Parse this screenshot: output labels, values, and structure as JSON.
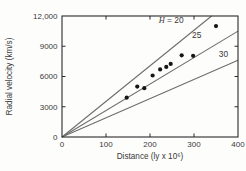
{
  "figure": {
    "background": "#fdfdfc"
  },
  "chart_data": {
    "type": "scatter",
    "title": "",
    "xlabel": "Distance (ly x 10⁶)",
    "ylabel": "Radial velocity (km/s)",
    "xlim": [
      0,
      400
    ],
    "ylim": [
      0,
      12000
    ],
    "grid": false,
    "frame": "full-box with inward ticks on all four sides",
    "xticks": [
      {
        "v": 0,
        "label": "0"
      },
      {
        "v": 100,
        "label": "100"
      },
      {
        "v": 200,
        "label": "200"
      },
      {
        "v": 300,
        "label": "300"
      },
      {
        "v": 400,
        "label": "400"
      }
    ],
    "yticks": [
      {
        "v": 0,
        "label": "0"
      },
      {
        "v": 3000,
        "label": "3000"
      },
      {
        "v": 6000,
        "label": "6000"
      },
      {
        "v": 9000,
        "label": "9000"
      },
      {
        "v": 12000,
        "label": "12,000"
      }
    ],
    "series": [
      {
        "name": "hubble-line-H20",
        "legend": "H = 20",
        "label_italic": "H",
        "label_rest": " = 20",
        "slope_km_s_per_Mly": 20,
        "points": [
          [
            0,
            0
          ],
          [
            340,
            12000
          ]
        ],
        "label_pos": [
          248,
          11300
        ]
      },
      {
        "name": "hubble-line-H25",
        "legend": "25",
        "label_italic": "",
        "label_rest": "25",
        "slope_km_s_per_Mly": 25,
        "points": [
          [
            0,
            0
          ],
          [
            400,
            10500
          ]
        ],
        "label_pos": [
          306,
          9800
        ]
      },
      {
        "name": "hubble-line-H30",
        "legend": "30",
        "label_italic": "",
        "label_rest": "30",
        "slope_km_s_per_Mly": 30,
        "points": [
          [
            0,
            0
          ],
          [
            400,
            7600
          ]
        ],
        "label_pos": [
          367,
          7950
        ]
      }
    ],
    "scatter": [
      [
        147,
        3900
      ],
      [
        171,
        5000
      ],
      [
        187,
        4840
      ],
      [
        206,
        6100
      ],
      [
        223,
        6700
      ],
      [
        237,
        6950
      ],
      [
        247,
        7250
      ],
      [
        272,
        8100
      ],
      [
        298,
        8050
      ],
      [
        350,
        11000
      ]
    ],
    "colors": {
      "line": "#6e6e6e",
      "point": "#161616",
      "axis": "#2b2b2b",
      "text": "#3a3a3a",
      "background": "#fdfdfc"
    }
  }
}
